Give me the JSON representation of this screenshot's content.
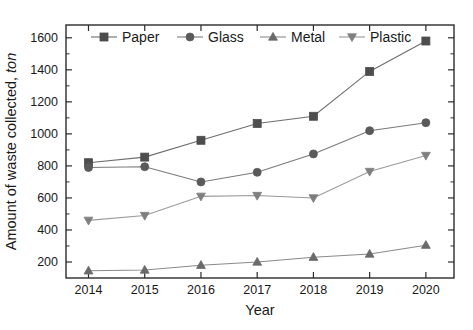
{
  "chart_data": {
    "type": "line",
    "title": "",
    "xlabel": "Year",
    "ylabel": "Amount of waste collected, ton",
    "ylabel_main": "Amount of waste collected,",
    "ylabel_unit": "ton",
    "categories": [
      "2014",
      "2015",
      "2016",
      "2017",
      "2018",
      "2019",
      "2020"
    ],
    "x": [
      2014,
      2015,
      2016,
      2017,
      2018,
      2019,
      2020
    ],
    "xlim": [
      2013.6,
      2020.5
    ],
    "ylim": [
      100,
      1680
    ],
    "yticks": [
      200,
      400,
      600,
      800,
      1000,
      1200,
      1400,
      1600
    ],
    "ytick_labels": [
      "200",
      "400",
      "600",
      "800",
      "1000",
      "1200",
      "1400",
      "1600"
    ],
    "grid": false,
    "legend_position": "top-center-inside",
    "series": [
      {
        "name": "Paper",
        "marker": "square",
        "color": "#4d4d4d",
        "line_color": "#6e6e6e",
        "values": [
          820,
          855,
          960,
          1065,
          1110,
          1390,
          1580
        ]
      },
      {
        "name": "Glass",
        "marker": "circle",
        "color": "#5a5a5a",
        "line_color": "#7a7a7a",
        "values": [
          790,
          795,
          700,
          760,
          875,
          1020,
          1070
        ]
      },
      {
        "name": "Metal",
        "marker": "triangle-up",
        "color": "#6a6a6a",
        "line_color": "#8a8a8a",
        "values": [
          145,
          150,
          180,
          200,
          230,
          250,
          305
        ]
      },
      {
        "name": "Plastic",
        "marker": "triangle-down",
        "color": "#7f7f7f",
        "line_color": "#9a9a9a",
        "values": [
          460,
          490,
          610,
          615,
          600,
          765,
          865
        ]
      }
    ]
  },
  "legend": {
    "entries": [
      {
        "label": "Paper"
      },
      {
        "label": "Glass"
      },
      {
        "label": "Metal"
      },
      {
        "label": "Plastic"
      }
    ]
  },
  "axes": {
    "x_title": "Year",
    "y_title_main": "Amount of waste collected,",
    "y_title_unit": "ton"
  }
}
